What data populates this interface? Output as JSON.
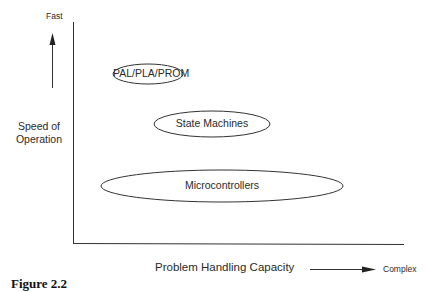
{
  "diagram": {
    "y_axis": {
      "top_label": "Fast",
      "title_line1": "Speed of",
      "title_line2": "Operation"
    },
    "x_axis": {
      "title": "Problem Handling Capacity",
      "right_label": "Complex"
    },
    "regions": [
      {
        "label": "PAL/PLA/PROM",
        "cx": 148,
        "cy": 74,
        "rx": 35,
        "ry": 10
      },
      {
        "label": "State Machines",
        "cx": 212,
        "cy": 124,
        "rx": 58,
        "ry": 13
      },
      {
        "label": "Microcontrollers",
        "cx": 222,
        "cy": 186,
        "rx": 121,
        "ry": 16
      }
    ],
    "caption": "Figure 2.2"
  }
}
